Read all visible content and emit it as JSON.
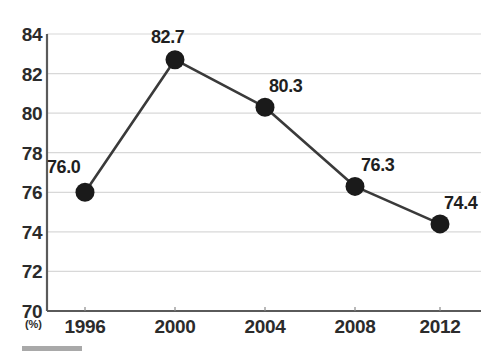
{
  "chart_data": {
    "type": "line",
    "title": "",
    "subtitle": "",
    "xlabel": "",
    "ylabel": "(%)",
    "categories": [
      "1996",
      "2000",
      "2004",
      "2008",
      "2012"
    ],
    "values": [
      76.0,
      82.7,
      80.3,
      76.3,
      74.4
    ],
    "point_labels": [
      "76.0",
      "82.7",
      "80.3",
      "76.3",
      "74.4"
    ],
    "ylim": [
      70,
      84
    ],
    "ytick_step": 2,
    "yticks": [
      "84",
      "82",
      "80",
      "78",
      "76",
      "74",
      "72",
      "70"
    ],
    "ytick_values": [
      84,
      82,
      80,
      78,
      76,
      74,
      72,
      70
    ],
    "grid": true,
    "legend": "none",
    "series": [
      {
        "name": "",
        "values": [
          76.0,
          82.7,
          80.3,
          76.3,
          74.4
        ]
      }
    ],
    "colors": {
      "line": "#3a3a3a",
      "marker": "#1a1a1a",
      "grid": "#d8d8d8",
      "axis": "#5a5a5a",
      "text": "#2b2b2b",
      "background": "#ffffff",
      "rule": "#a9a9a9"
    }
  },
  "axis": {
    "unit_label": "(%)"
  }
}
